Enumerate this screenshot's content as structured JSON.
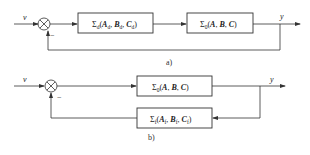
{
  "diagrams": {
    "a": {
      "caption": "a)",
      "input_label": "v",
      "output_label": "y",
      "feedback_sign": "−",
      "blocks": [
        {
          "sigma": "Σ",
          "sigma_sub": "d",
          "args": [
            {
              "name": "A",
              "sub": "d"
            },
            {
              "name": "B",
              "sub": "d"
            },
            {
              "name": "C",
              "sub": "d"
            }
          ]
        },
        {
          "sigma": "Σ",
          "sigma_sub": "0",
          "args": [
            {
              "name": "A",
              "sub": ""
            },
            {
              "name": "B",
              "sub": ""
            },
            {
              "name": "C",
              "sub": ""
            }
          ]
        }
      ]
    },
    "b": {
      "caption": "b)",
      "input_label": "v",
      "output_label": "y",
      "feedback_sign": "−",
      "blocks": [
        {
          "sigma": "Σ",
          "sigma_sub": "0",
          "args": [
            {
              "name": "A",
              "sub": ""
            },
            {
              "name": "B",
              "sub": ""
            },
            {
              "name": "C",
              "sub": ""
            }
          ]
        },
        {
          "sigma": "Σ",
          "sigma_sub": "f",
          "args": [
            {
              "name": "A",
              "sub": "f"
            },
            {
              "name": "B",
              "sub": "f"
            },
            {
              "name": "C",
              "sub": "f"
            }
          ]
        }
      ]
    }
  },
  "punct": {
    "open": "(",
    "close": ")",
    "comma": ", "
  }
}
